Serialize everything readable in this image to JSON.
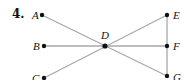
{
  "problem_number": "4.",
  "colors": {
    "line": "#a8a8a8",
    "point": "#111111",
    "text": "#111111"
  },
  "points": [
    {
      "id": "A",
      "label": "A",
      "x": 42,
      "y": 15,
      "lx": 32,
      "ly": 10
    },
    {
      "id": "B",
      "label": "B",
      "x": 44,
      "y": 46,
      "lx": 33,
      "ly": 41
    },
    {
      "id": "C",
      "label": "C",
      "x": 44,
      "y": 78,
      "lx": 32,
      "ly": 73
    },
    {
      "id": "D",
      "label": "D",
      "x": 105,
      "y": 46,
      "lx": 101,
      "ly": 30
    },
    {
      "id": "E",
      "label": "E",
      "x": 167,
      "y": 15,
      "lx": 173,
      "ly": 10
    },
    {
      "id": "F",
      "label": "F",
      "x": 167,
      "y": 46,
      "lx": 173,
      "ly": 41
    },
    {
      "id": "G",
      "label": "G",
      "x": 167,
      "y": 76,
      "lx": 173,
      "ly": 72
    }
  ],
  "segments": [
    {
      "from": "A",
      "to": "G"
    },
    {
      "from": "C",
      "to": "E"
    },
    {
      "from": "B",
      "to": "F"
    },
    {
      "from": "E",
      "to": "F"
    },
    {
      "from": "F",
      "to": "G"
    }
  ]
}
